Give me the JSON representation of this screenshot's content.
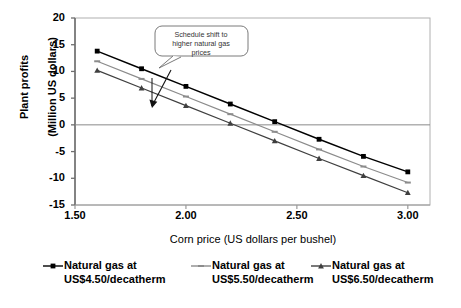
{
  "chart_data": {
    "type": "line",
    "title": "",
    "xlabel": "Corn price (US dollars per bushel)",
    "ylabel_line1": "Plant profits",
    "ylabel_line2": "(Million US dollars)",
    "xlim": [
      1.5,
      3.1
    ],
    "ylim": [
      -15,
      20
    ],
    "xticks": [
      "1.50",
      "2.00",
      "2.50",
      "3.00"
    ],
    "xtick_values": [
      1.5,
      2.0,
      2.5,
      3.0
    ],
    "yticks": [
      "20",
      "15",
      "10",
      "5",
      "0",
      "-5",
      "-10",
      "-15"
    ],
    "ytick_values": [
      20,
      15,
      10,
      5,
      0,
      -5,
      -10,
      -15
    ],
    "grid": false,
    "zero_line": true,
    "legend_position": "bottom",
    "x": [
      1.6,
      1.8,
      2.0,
      2.2,
      2.4,
      2.6,
      2.8,
      3.0
    ],
    "series": [
      {
        "name": "Natural gas at US$4.50/decatherm",
        "label_line1": "Natural gas at",
        "label_line2": "US$4.50/decatherm",
        "color": "#000000",
        "marker": "square",
        "values": [
          13.8,
          10.5,
          7.2,
          3.9,
          0.6,
          -2.7,
          -5.9,
          -8.8
        ]
      },
      {
        "name": "Natural gas at US$5.50/decatherm",
        "label_line1": "Natural gas at",
        "label_line2": "US$5.50/decatherm",
        "color": "#8c8c8c",
        "marker": "dash",
        "values": [
          11.9,
          8.6,
          5.3,
          2.0,
          -1.3,
          -4.6,
          -7.8,
          -10.8
        ]
      },
      {
        "name": "Natural gas at US$6.50/decatherm",
        "label_line1": "Natural gas at",
        "label_line2": "US$6.50/decatherm",
        "color": "#3f3f3f",
        "marker": "triangle",
        "values": [
          10.2,
          6.9,
          3.6,
          0.3,
          -3.0,
          -6.3,
          -9.5,
          -12.7
        ]
      }
    ],
    "annotations": [
      {
        "name": "schedule-shift-callout",
        "line1": "Schedule shift to",
        "line2": "higher natural gas",
        "line3": "prices",
        "arrow": "points down-left to the series lines"
      }
    ]
  }
}
